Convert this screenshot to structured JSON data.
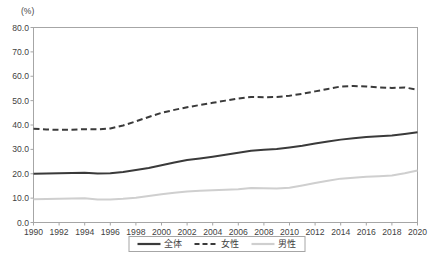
{
  "chart_data": {
    "type": "line",
    "title": "",
    "subtitle": "",
    "unit_label": "(%)",
    "xlabel": "",
    "ylabel": "",
    "grid": false,
    "legend_position": "bottom",
    "ylim": [
      0.0,
      80.0
    ],
    "ytick_labels": [
      "0.0",
      "10.0",
      "20.0",
      "30.0",
      "40.0",
      "50.0",
      "60.0",
      "70.0",
      "80.0"
    ],
    "yticks": [
      0.0,
      10.0,
      20.0,
      30.0,
      40.0,
      50.0,
      60.0,
      70.0,
      80.0
    ],
    "xlim": [
      1990,
      2020
    ],
    "xtick_labels": [
      "1990",
      "1992",
      "1994",
      "1996",
      "1998",
      "2000",
      "2002",
      "2004",
      "2006",
      "2008",
      "2010",
      "2012",
      "2014",
      "2016",
      "2018",
      "2020"
    ],
    "xticks": [
      1990,
      1992,
      1994,
      1996,
      1998,
      2000,
      2002,
      2004,
      2006,
      2008,
      2010,
      2012,
      2014,
      2016,
      2018,
      2020
    ],
    "x": [
      1990,
      1991,
      1992,
      1993,
      1994,
      1995,
      1996,
      1997,
      1998,
      1999,
      2000,
      2001,
      2002,
      2003,
      2004,
      2005,
      2006,
      2007,
      2008,
      2009,
      2010,
      2011,
      2012,
      2013,
      2014,
      2015,
      2016,
      2017,
      2018,
      2019,
      2020
    ],
    "series": [
      {
        "name": "全体",
        "style": "solid",
        "color": "#3a3a3a",
        "width": 2.0,
        "values": [
          20.0,
          20.1,
          20.2,
          20.3,
          20.4,
          20.1,
          20.2,
          20.7,
          21.5,
          22.4,
          23.5,
          24.6,
          25.6,
          26.3,
          27.0,
          27.8,
          28.6,
          29.4,
          29.8,
          30.2,
          30.8,
          31.5,
          32.4,
          33.2,
          34.0,
          34.6,
          35.1,
          35.4,
          35.7,
          36.3,
          37.0
        ]
      },
      {
        "name": "女性",
        "style": "dashed",
        "color": "#3a3a3a",
        "width": 2.0,
        "values": [
          38.5,
          38.2,
          38.0,
          38.1,
          38.3,
          38.2,
          38.6,
          39.8,
          41.5,
          43.3,
          45.0,
          46.2,
          47.3,
          48.2,
          49.1,
          50.0,
          50.9,
          51.5,
          51.4,
          51.5,
          52.0,
          52.8,
          53.8,
          54.8,
          55.8,
          56.0,
          55.8,
          55.4,
          55.2,
          55.4,
          54.5
        ]
      },
      {
        "name": "男性",
        "style": "solid",
        "color": "#cfcfcf",
        "width": 2.0,
        "values": [
          9.5,
          9.6,
          9.7,
          9.8,
          9.9,
          9.4,
          9.4,
          9.7,
          10.2,
          10.9,
          11.6,
          12.2,
          12.7,
          13.0,
          13.2,
          13.4,
          13.6,
          14.2,
          14.1,
          13.9,
          14.3,
          15.2,
          16.2,
          17.1,
          18.0,
          18.4,
          18.8,
          19.0,
          19.3,
          20.2,
          21.3
        ]
      }
    ]
  },
  "legend": {
    "items": [
      {
        "label": "全体",
        "style": "solid",
        "color": "#3a3a3a"
      },
      {
        "label": "女性",
        "style": "dashed",
        "color": "#3a3a3a"
      },
      {
        "label": "男性",
        "style": "solid",
        "color": "#cfcfcf"
      }
    ]
  },
  "colors": {
    "total": "#3a3a3a",
    "female": "#3a3a3a",
    "male": "#cfcfcf",
    "frame": "#a6a6a6",
    "text": "#3f3f3f",
    "background": "#ffffff"
  }
}
